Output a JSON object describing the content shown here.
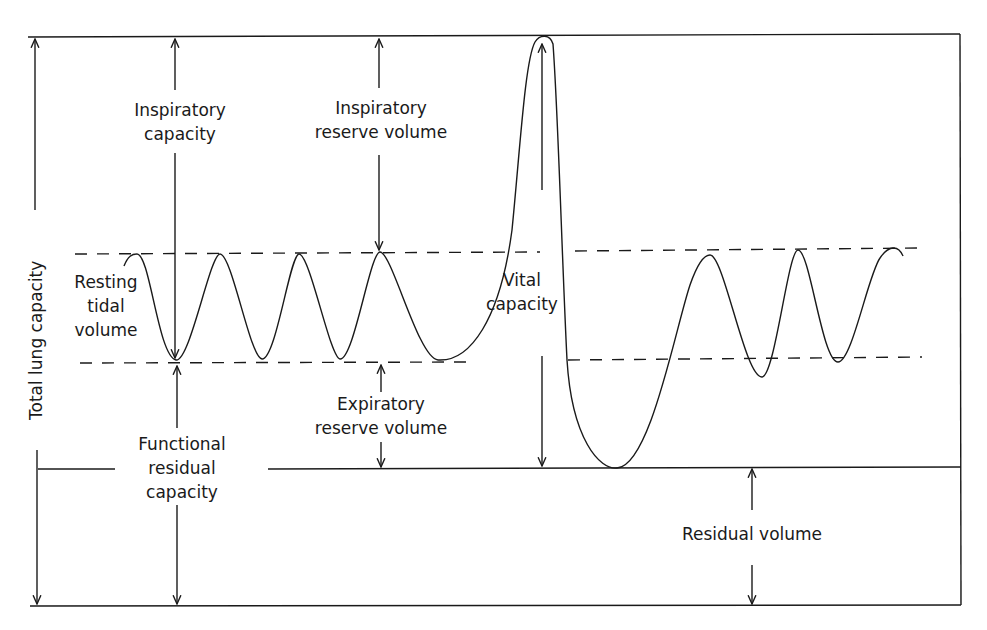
{
  "diagram": {
    "colors": {
      "line": "#1a1a1a",
      "background": "#ffffff"
    },
    "labels": {
      "total_lung_capacity": "Total lung capacity",
      "inspiratory_capacity": {
        "line1": "Inspiratory",
        "line2": "capacity"
      },
      "inspiratory_reserve_volume": {
        "line1": "Inspiratory",
        "line2": "reserve volume"
      },
      "resting_tidal_volume": {
        "line1": "Resting",
        "line2": "tidal",
        "line3": "volume"
      },
      "vital_capacity": {
        "line1": "Vital",
        "line2": "capacity"
      },
      "expiratory_reserve_volume": {
        "line1": "Expiratory",
        "line2": "reserve volume"
      },
      "functional_residual_capacity": {
        "line1": "Functional",
        "line2": "residual",
        "line3": "capacity"
      },
      "residual_volume": "Residual volume"
    },
    "levels": {
      "total_lung_capacity_y": 37,
      "tidal_peak_y": 253,
      "tidal_trough_y": 363,
      "residual_volume_y": 467,
      "zero_y": 605
    },
    "nodes": [
      "Total lung capacity",
      "Inspiratory capacity",
      "Inspiratory reserve volume",
      "Resting tidal volume",
      "Vital capacity",
      "Expiratory reserve volume",
      "Functional residual capacity",
      "Residual volume"
    ]
  }
}
